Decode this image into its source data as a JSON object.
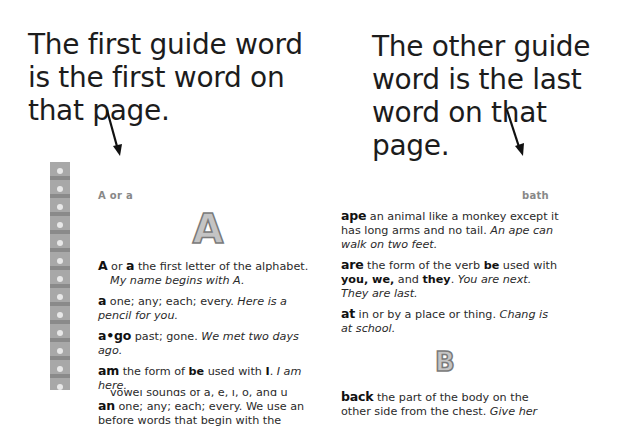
{
  "callouts": {
    "left": "The first guide word is the first word on that page.",
    "right": "The other guide word is the last word on that page."
  },
  "page": {
    "guide_word_left": "A or a",
    "guide_word_right": "bath",
    "section_letters": [
      "A",
      "B"
    ],
    "left_column": [
      {
        "headword": "A",
        "def": "or",
        "headword2": "a",
        "text": "the first letter of the alphabet.",
        "example": "My name begins with A."
      },
      {
        "headword": "a",
        "text": "one; any; each; every.",
        "example": "Here is a pencil for you."
      },
      {
        "headword": "a•go",
        "text": "past; gone.",
        "example": "We met two days ago."
      },
      {
        "headword": "am",
        "text_before": "the form of",
        "bold1": "be",
        "text_mid": "used with",
        "bold2": "I",
        "example": "I am here."
      },
      {
        "headword": "an",
        "text": "one; any; each; every. We use an before words that begin with the",
        "cutoff": "vowel sounds of a, e, i, o, and u"
      }
    ],
    "right_column": [
      {
        "headword": "ape",
        "text": "an animal like a monkey except it has long arms and no tail.",
        "example": "An ape can walk on two feet."
      },
      {
        "headword": "are",
        "text_before": "the form of the verb",
        "bold1": "be",
        "text_mid": "used with",
        "bold2": "you, we,",
        "text_and": "and",
        "bold3": "they",
        "example": "You are next. They are last."
      },
      {
        "headword": "at",
        "text": "in or by a place or thing.",
        "example": "Chang is at school."
      },
      {
        "headword": "back",
        "text": "the part of the body on the other side from the chest.",
        "example": "Give her"
      }
    ]
  }
}
